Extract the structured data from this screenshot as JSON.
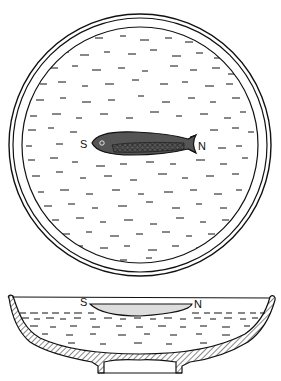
{
  "figure": {
    "colors": {
      "ink": "#111111",
      "background": "#ffffff"
    },
    "plan_view": {
      "labels": {
        "south": "S",
        "north": "N"
      }
    },
    "section_view": {
      "labels": {
        "south": "S",
        "north": "N"
      }
    }
  }
}
